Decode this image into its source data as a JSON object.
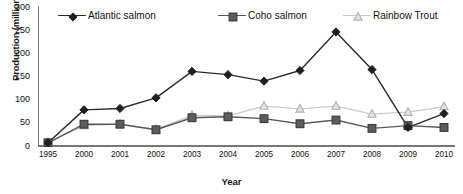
{
  "chart_data": {
    "type": "line",
    "title": "",
    "xlabel": "Year",
    "ylabel": "Production (millions)",
    "categories": [
      "1995",
      "2000",
      "2001",
      "2002",
      "2003",
      "2004",
      "2005",
      "2006",
      "2007",
      "2008",
      "2009",
      "2010"
    ],
    "ylim": [
      0,
      300
    ],
    "yticks": [
      0,
      50,
      100,
      150,
      200,
      250,
      300
    ],
    "grid": false,
    "legend_position": "top",
    "series": [
      {
        "name": "Atlantic salmon",
        "marker": "diamond",
        "color": "#2b2b2b",
        "values": [
          7,
          78,
          81,
          104,
          161,
          154,
          140,
          163,
          246,
          165,
          40,
          70
        ]
      },
      {
        "name": "Coho salmon",
        "marker": "square",
        "color": "#595959",
        "values": [
          7,
          47,
          47,
          35,
          61,
          63,
          59,
          48,
          56,
          38,
          44,
          40
        ]
      },
      {
        "name": "Rainbow Trout",
        "marker": "triangle",
        "color": "#c9c9c9",
        "values": [
          7,
          44,
          47,
          36,
          66,
          65,
          86,
          80,
          86,
          69,
          73,
          85
        ]
      }
    ]
  },
  "axis": {
    "y_tick_labels": [
      "0",
      "50",
      "100",
      "150",
      "200",
      "250",
      "300"
    ],
    "x_tick_labels": [
      "1995",
      "2000",
      "2001",
      "2002",
      "2003",
      "2004",
      "2005",
      "2006",
      "2007",
      "2008",
      "2009",
      "2010"
    ],
    "x_title": "Year",
    "y_title": "Production (millions)"
  },
  "legend": {
    "items": [
      {
        "label": "Atlantic salmon",
        "icon": "diamond-marker-icon"
      },
      {
        "label": "Coho salmon",
        "icon": "square-marker-icon"
      },
      {
        "label": "Rainbow Trout",
        "icon": "triangle-marker-icon"
      }
    ]
  }
}
